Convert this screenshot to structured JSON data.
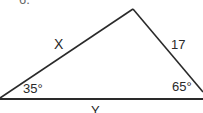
{
  "problem": {
    "number": "6."
  },
  "triangle": {
    "side_left_label": "X",
    "side_right_label": "17",
    "side_base_label": "Y",
    "angle_left_label": "35°",
    "angle_right_label": "65°"
  },
  "colors": {
    "line": "#2a2a2a",
    "background": "#ffffff"
  }
}
